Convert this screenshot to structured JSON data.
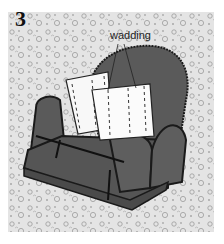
{
  "figure": {
    "step_number": "3",
    "callout_label": "wadding",
    "colors": {
      "background": "#e4e4e4",
      "pattern": "#9a9a9a",
      "chair_fill": "#5a5a5a",
      "chair_outline": "#1a1a1a",
      "wadding_fill": "#f8f8f8"
    }
  }
}
